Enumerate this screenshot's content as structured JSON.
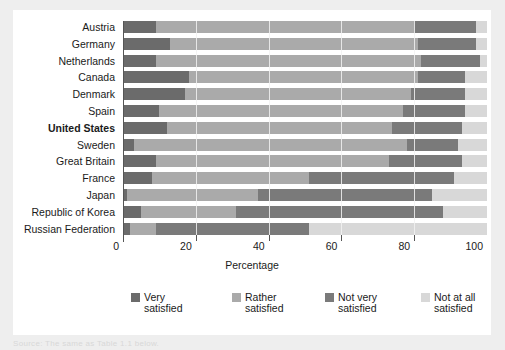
{
  "chart_data": {
    "type": "bar",
    "orientation": "horizontal",
    "stacked": true,
    "title": "",
    "xlabel": "Percentage",
    "ylabel": "",
    "xlim": [
      0,
      100
    ],
    "xticks": [
      0,
      20,
      40,
      60,
      80,
      100
    ],
    "grid": true,
    "grid_axis": "x",
    "legend_position": "bottom",
    "categories": [
      "Austria",
      "Germany",
      "Netherlands",
      "Canada",
      "Denmark",
      "Spain",
      "United States",
      "Sweden",
      "Great Britain",
      "France",
      "Japan",
      "Republic of Korea",
      "Russian Federation"
    ],
    "highlight_category": "United States",
    "series": [
      {
        "name": "Very satisfied",
        "color": "#6b6b6b",
        "values": [
          9,
          13,
          9,
          18,
          17,
          10,
          12,
          3,
          9,
          8,
          1,
          5,
          2
        ]
      },
      {
        "name": "Rather satisfied",
        "color": "#aaaaaa",
        "values": [
          71,
          68,
          73,
          63,
          62,
          67,
          62,
          75,
          64,
          43,
          36,
          26,
          7
        ]
      },
      {
        "name": "Not very satisfied",
        "color": "#7a7a7a",
        "values": [
          17,
          16,
          16,
          13,
          15,
          17,
          19,
          14,
          20,
          40,
          48,
          57,
          42
        ]
      },
      {
        "name": "Not at all satisfied",
        "color": "#d8d8d8",
        "values": [
          3,
          3,
          2,
          6,
          6,
          6,
          7,
          8,
          7,
          9,
          15,
          12,
          49
        ]
      }
    ]
  },
  "legend": {
    "items": [
      {
        "label": "Very\nsatisfied",
        "color": "#6b6b6b"
      },
      {
        "label": "Rather\nsatisfied",
        "color": "#aaaaaa"
      },
      {
        "label": "Not very\nsatisfied",
        "color": "#7a7a7a"
      },
      {
        "label": "Not at all\nsatisfied",
        "color": "#d8d8d8"
      }
    ]
  },
  "footnote": "Source: The same as Table 1.1 below."
}
